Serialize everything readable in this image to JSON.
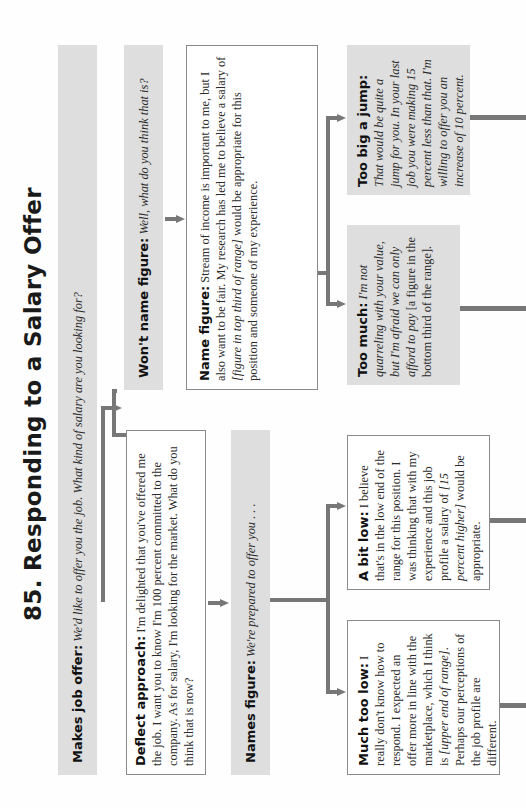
{
  "title": "85. Responding to a Salary Offer",
  "orientation": "rotated 90° counter-clockwise",
  "nodes": {
    "makes_offer": {
      "label": "Makes job offer:",
      "text": "We'd like to offer you the job. What kind of salary are you looking for?"
    },
    "deflect": {
      "label": "Deflect approach:",
      "text": "I'm delighted that you've offered me the job. I want you to know I'm 100 percent committed to the company. As for salary, I'm looking for the market. What do you think that is now?"
    },
    "wont_name": {
      "label": "Won't name figure:",
      "text": "Well, what do you think that is?"
    },
    "name_figure": {
      "label": "Name figure:",
      "text_a": "Stream of income is important to me, but I also want to be fair. My research has led me to believe a salary of ",
      "text_em": "[figure in top third of range]",
      "text_b": " would be appropriate for this position and someone of my experience."
    },
    "names_figure": {
      "label": "Names figure:",
      "text": "We're prepared to offer you . . ."
    },
    "too_much": {
      "label": "Too much:",
      "text_em": "I'm not quarreling with your value, but I'm afraid we can only afford to pay",
      "text_b": " [a figure in the bottom third of the range]."
    },
    "too_big": {
      "label": "Too big a jump:",
      "text": "That would be quite a jump for you. In your last job you were making 15 percent less than that. I'm willing to offer you an increase of 10 percent."
    },
    "much_too_low": {
      "label": "Much too low:",
      "text_a": "I really don't know how to respond. I expected an offer more in line with the marketplace, which I think is ",
      "text_em": "[upper end of range]",
      "text_b": ". Perhaps our perceptions of the job profile are different."
    },
    "bit_low": {
      "label": "A bit low:",
      "text_a": "I believe that's in the low end of the range for this position. I was thinking that with my experience and this job profile a salary of ",
      "text_em": "[15 percent higher]",
      "text_b": " would be appropriate."
    }
  },
  "colors": {
    "grey_box": "#dedede",
    "connector": "#777777",
    "outline": "#8a8a8a"
  }
}
